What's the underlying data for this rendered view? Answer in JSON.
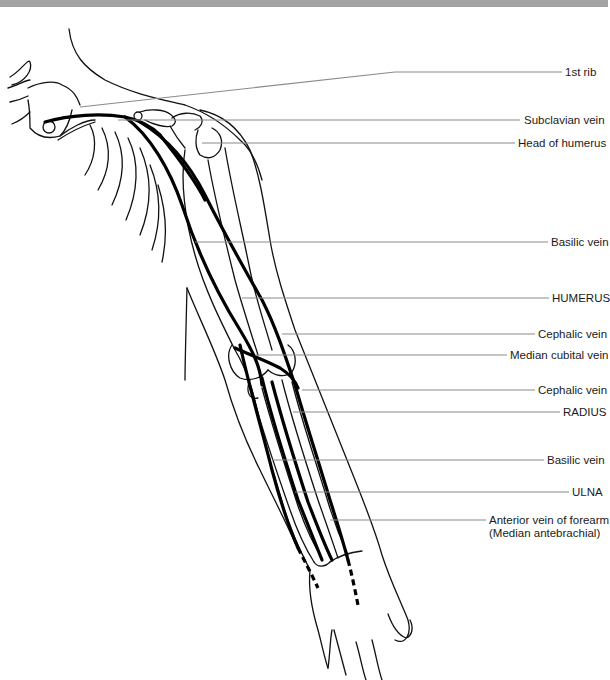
{
  "diagram": {
    "colors": {
      "banner": "#a3a3a3",
      "vein": "#000000",
      "outline": "#111111",
      "leader": "#8a8a8a",
      "text": "#1a1a1a"
    },
    "labels": [
      {
        "id": "first-rib",
        "text": "1st rib",
        "x": 565,
        "y": 66
      },
      {
        "id": "subclavian-vein",
        "text": "Subclavian vein",
        "x": 524,
        "y": 114
      },
      {
        "id": "head-of-humerus",
        "text": "Head of humerus",
        "x": 518,
        "y": 137
      },
      {
        "id": "basilic-vein-upper",
        "text": "Basilic vein",
        "x": 551,
        "y": 236
      },
      {
        "id": "humerus",
        "text": "HUMERUS",
        "x": 552,
        "y": 292
      },
      {
        "id": "cephalic-vein-upper",
        "text": "Cephalic vein",
        "x": 538,
        "y": 328
      },
      {
        "id": "median-cubital-vein",
        "text": "Median cubital vein",
        "x": 510,
        "y": 349
      },
      {
        "id": "cephalic-vein-lower",
        "text": "Cephalic vein",
        "x": 538,
        "y": 384
      },
      {
        "id": "radius",
        "text": "RADIUS",
        "x": 563,
        "y": 406
      },
      {
        "id": "basilic-vein-lower",
        "text": "Basilic vein",
        "x": 547,
        "y": 454
      },
      {
        "id": "ulna",
        "text": "ULNA",
        "x": 572,
        "y": 486
      },
      {
        "id": "anterior-vein-forearm",
        "text": "Anterior vein of forearm",
        "x": 489,
        "y": 514
      },
      {
        "id": "median-antebrachial",
        "text": "(Median antebrachial)",
        "x": 489,
        "y": 527
      }
    ]
  }
}
